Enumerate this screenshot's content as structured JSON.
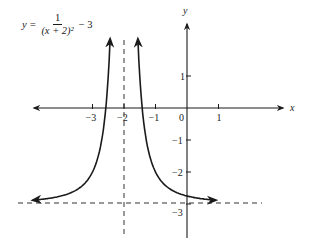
{
  "equation": {
    "lhs": "y =",
    "numerator": "1",
    "denominator": "(x + 2)²",
    "tail": "− 3"
  },
  "axes": {
    "x_label": "x",
    "y_label": "y",
    "x_ticks": [
      {
        "value": -3,
        "label": "−3"
      },
      {
        "value": -2,
        "label": "−2"
      },
      {
        "value": -1,
        "label": "−1"
      },
      {
        "value": 0,
        "label": "0"
      },
      {
        "value": 1,
        "label": "1"
      }
    ],
    "y_ticks": [
      {
        "value": 1,
        "label": "1"
      },
      {
        "value": -1,
        "label": "−1"
      },
      {
        "value": -2,
        "label": "−2"
      },
      {
        "value": -3,
        "label": "−3"
      }
    ]
  },
  "chart_data": {
    "type": "line",
    "xlabel": "x",
    "ylabel": "y",
    "function": "1/(x+2)^2 - 3",
    "xlim": [
      -5.0,
      3.5
    ],
    "ylim": [
      -4.0,
      3.0
    ],
    "grid": false,
    "asymptotes": {
      "vertical": -2,
      "horizontal": -3
    },
    "series": [
      {
        "name": "left branch",
        "x": [
          -4.8,
          -4,
          -3,
          -2.6,
          -2.45,
          -2.35
        ],
        "y": [
          -2.87,
          -2.75,
          -2,
          -0.22,
          1.94,
          5.16
        ]
      },
      {
        "name": "right branch",
        "x": [
          -1.65,
          -1.55,
          -1.4,
          -1,
          0,
          1.1
        ],
        "y": [
          5.16,
          1.94,
          -0.22,
          -2,
          -2.75,
          -2.9
        ]
      }
    ],
    "x_ticks": [
      -3,
      -2,
      -1,
      0,
      1
    ],
    "y_ticks": [
      1,
      -1,
      -2,
      -3
    ]
  }
}
